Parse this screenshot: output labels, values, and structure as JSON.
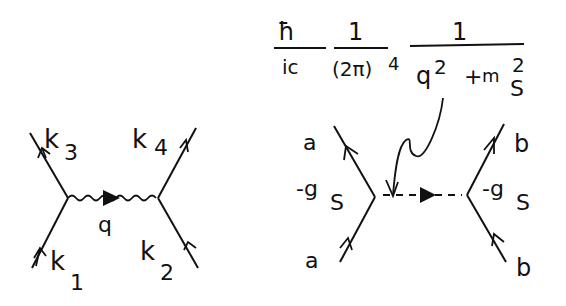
{
  "left_diagram": {
    "labels": {
      "k1": "k",
      "k1_sub": "1",
      "k2": "k",
      "k2_sub": "2",
      "k3": "k",
      "k3_sub": "3",
      "k4": "k",
      "k4_sub": "4",
      "q": "q"
    }
  },
  "right_diagram": {
    "propagator": {
      "hbar": "ħ",
      "ic": "ic",
      "one_a": "1",
      "two_pi": "(2π)",
      "two_pi_exp": "4",
      "one_b": "1",
      "q": "q",
      "q_exp": "2",
      "plus": "+",
      "m": "m",
      "m_exp": "2",
      "m_sub": "S"
    },
    "labels": {
      "a_top": "a",
      "a_bottom": "a",
      "b_top": "b",
      "b_bottom": "b",
      "coupling_left": "-g",
      "coupling_left_sub": "S",
      "coupling_right": "-g",
      "coupling_right_sub": "S"
    }
  }
}
